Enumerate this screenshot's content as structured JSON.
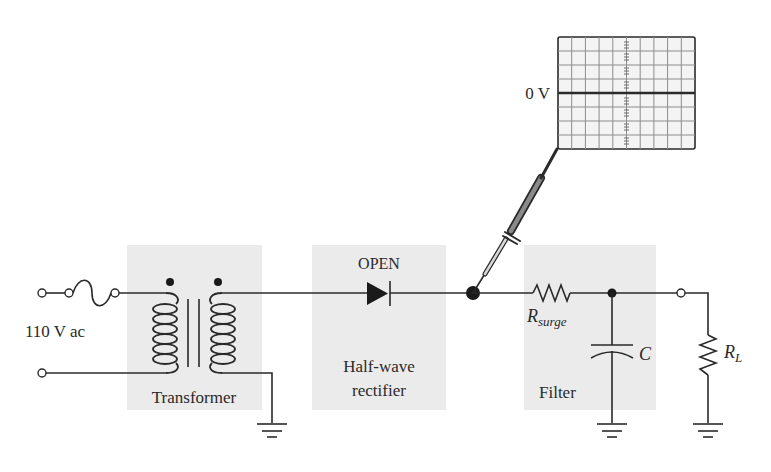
{
  "diagram": {
    "type": "circuit-schematic",
    "colors": {
      "wire": "#2a2a2a",
      "block_background": "#ebebeb",
      "scope_screen": "#f4f4f4",
      "scope_grid": "#8c8c8c"
    },
    "source": {
      "label": "110 V ac"
    },
    "blocks": [
      {
        "id": "transformer",
        "label": "Transformer"
      },
      {
        "id": "rectifier",
        "label_line1": "Half-wave",
        "label_line2": "rectifier",
        "fault_label": "OPEN"
      },
      {
        "id": "filter",
        "label": "Filter"
      }
    ],
    "components": {
      "fuse": "fuse-icon",
      "transformer": "transformer-icon",
      "diode": "diode-icon",
      "r_surge": {
        "label_main": "R",
        "label_sub": "surge"
      },
      "capacitor": {
        "label": "C"
      },
      "load": {
        "label_main": "R",
        "label_sub": "L"
      }
    },
    "oscilloscope": {
      "trace_label": "0 V",
      "grid_columns": 10,
      "grid_rows": 8,
      "trace": "flat line at 0 V"
    }
  }
}
